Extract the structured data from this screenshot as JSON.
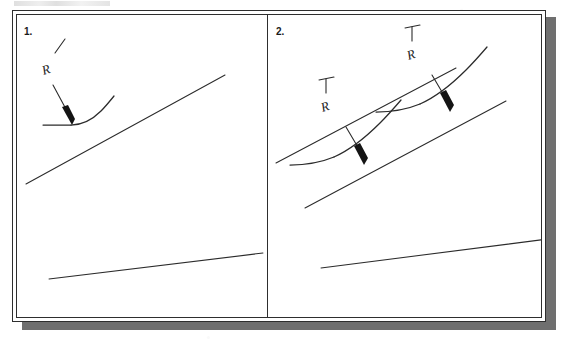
{
  "figure": {
    "kind": "scanned-technical-drawing",
    "frame_border_color": "#2e2e2e",
    "shadow_color": "#6f6f6f",
    "paper_color": "#ffffff",
    "ink_color": "#2b2b2b"
  },
  "panels": [
    {
      "number": "1.",
      "callouts": [
        {
          "symbol": "R"
        }
      ]
    },
    {
      "number": "2.",
      "callouts": [
        {
          "symbol": "R"
        },
        {
          "symbol": "R"
        }
      ]
    }
  ]
}
